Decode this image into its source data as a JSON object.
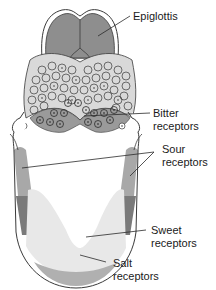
{
  "diagram": {
    "type": "anatomical-illustration",
    "labels": {
      "epiglottis": "Epiglottis",
      "bitter_line1": "Bitter",
      "bitter_line2": "receptors",
      "sour_line1": "Sour",
      "sour_line2": "receptors",
      "sweet_line1": "Sweet",
      "sweet_line2": "receptors",
      "salt_line1": "Salt",
      "salt_line2": "receptors"
    },
    "colors": {
      "outline": "#3a3a3a",
      "epiglottis": "#8e8e8e",
      "papillae_region": "#d9d9d9",
      "bitter_region": "#9a9a9a",
      "sour_light": "#a8a8a8",
      "sour_dark": "#7a7a7a",
      "sweet_region": "#e8e8e8",
      "salt_region": "#b0b0b0",
      "background": "#ffffff"
    }
  }
}
